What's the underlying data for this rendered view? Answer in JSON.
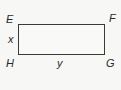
{
  "figure": {
    "shape": "rectangle",
    "vertices": {
      "top_left": "E",
      "top_right": "F",
      "bottom_right": "G",
      "bottom_left": "H"
    },
    "side_labels": {
      "left": "x",
      "bottom": "y"
    },
    "colors": {
      "stroke": "#3a3a3a",
      "background": "#f7f7f5",
      "text": "#2a2a2a"
    }
  }
}
